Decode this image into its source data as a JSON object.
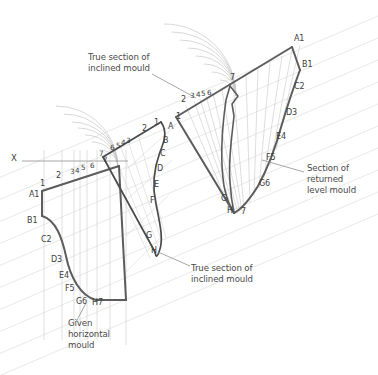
{
  "drawing": {
    "title": "Geometric construction: inclined and returned level moulds",
    "colors": {
      "outline": "#5c5c5c",
      "outline_dark": "#4a4a4a",
      "construction": "#c9c9c9",
      "construction_light": "#dcdcdc",
      "arc": "#b5b5b5",
      "text": "#3d3d3d",
      "leader": "#8a8a8a",
      "background": "#ffffff"
    },
    "annotations": [
      {
        "id": "note-true-section-top",
        "text": "True section of\ninclined mould",
        "x": 88,
        "y": 57
      },
      {
        "id": "note-section-returned",
        "text": "Section of\nreturned\nlevel mould",
        "x": 308,
        "y": 168
      },
      {
        "id": "note-true-section-bottom",
        "text": "True section of\ninclined mould",
        "x": 193,
        "y": 268
      },
      {
        "id": "note-given-horizontal",
        "text": "Given\nhorizontal\nmould",
        "x": 70,
        "y": 312
      }
    ],
    "axis_label": {
      "id": "x-axis-label",
      "text": "X",
      "x": 13,
      "y": 158
    },
    "left_figure": {
      "name": "given-horizontal-mould",
      "numbers": [
        {
          "text": "1",
          "x": 40,
          "y": 185
        },
        {
          "text": "2",
          "x": 56,
          "y": 178
        },
        {
          "text": "3",
          "x": 70,
          "y": 175
        },
        {
          "text": "4",
          "x": 76,
          "y": 175
        },
        {
          "text": "5",
          "x": 83,
          "y": 172
        },
        {
          "text": "6",
          "x": 92,
          "y": 169
        },
        {
          "text": "7",
          "x": 104,
          "y": 165
        }
      ],
      "letters": [
        {
          "text": "A1",
          "x": 30,
          "y": 196
        },
        {
          "text": "B1",
          "x": 28,
          "y": 222
        },
        {
          "text": "C2",
          "x": 42,
          "y": 241
        },
        {
          "text": "D3",
          "x": 52,
          "y": 261
        },
        {
          "text": "E4",
          "x": 60,
          "y": 276
        },
        {
          "text": "F5",
          "x": 66,
          "y": 289
        },
        {
          "text": "G6",
          "x": 77,
          "y": 302
        },
        {
          "text": "H7",
          "x": 93,
          "y": 303
        }
      ]
    },
    "mid_figure": {
      "name": "true-section-inclined-mould",
      "numbers": [
        {
          "text": "1",
          "x": 155,
          "y": 124
        },
        {
          "text": "2",
          "x": 143,
          "y": 130
        },
        {
          "text": "3",
          "x": 127,
          "y": 142
        },
        {
          "text": "4",
          "x": 122,
          "y": 144
        },
        {
          "text": "5",
          "x": 117,
          "y": 147
        },
        {
          "text": "6",
          "x": 111,
          "y": 149
        },
        {
          "text": "7",
          "x": 100,
          "y": 156
        }
      ],
      "letters": [
        {
          "text": "A",
          "x": 169,
          "y": 128
        },
        {
          "text": "B",
          "x": 164,
          "y": 142
        },
        {
          "text": "C",
          "x": 161,
          "y": 155
        },
        {
          "text": "D",
          "x": 158,
          "y": 170
        },
        {
          "text": "E",
          "x": 155,
          "y": 186
        },
        {
          "text": "F",
          "x": 151,
          "y": 202
        },
        {
          "text": "G",
          "x": 147,
          "y": 237
        },
        {
          "text": "H",
          "x": 152,
          "y": 252
        }
      ]
    },
    "right_figure": {
      "name": "section-returned-level-mould",
      "numbers": [
        {
          "text": "2",
          "x": 182,
          "y": 101
        },
        {
          "text": "3",
          "x": 191,
          "y": 97
        },
        {
          "text": "4",
          "x": 197,
          "y": 96
        },
        {
          "text": "5",
          "x": 202,
          "y": 95
        },
        {
          "text": "6",
          "x": 208,
          "y": 94
        },
        {
          "text": "7",
          "x": 231,
          "y": 79
        },
        {
          "text": "1",
          "x": 177,
          "y": 118
        },
        {
          "text": "7b",
          "x": 238,
          "y": 212
        }
      ],
      "letters": [
        {
          "text": "A1",
          "x": 295,
          "y": 40
        },
        {
          "text": "B1",
          "x": 302,
          "y": 66
        },
        {
          "text": "C2",
          "x": 295,
          "y": 88
        },
        {
          "text": "D3",
          "x": 287,
          "y": 114
        },
        {
          "text": "E4",
          "x": 277,
          "y": 138
        },
        {
          "text": "F5",
          "x": 267,
          "y": 159
        },
        {
          "text": "G6",
          "x": 260,
          "y": 185
        },
        {
          "text": "G",
          "x": 222,
          "y": 200
        },
        {
          "text": "H",
          "x": 228,
          "y": 212
        }
      ]
    }
  }
}
